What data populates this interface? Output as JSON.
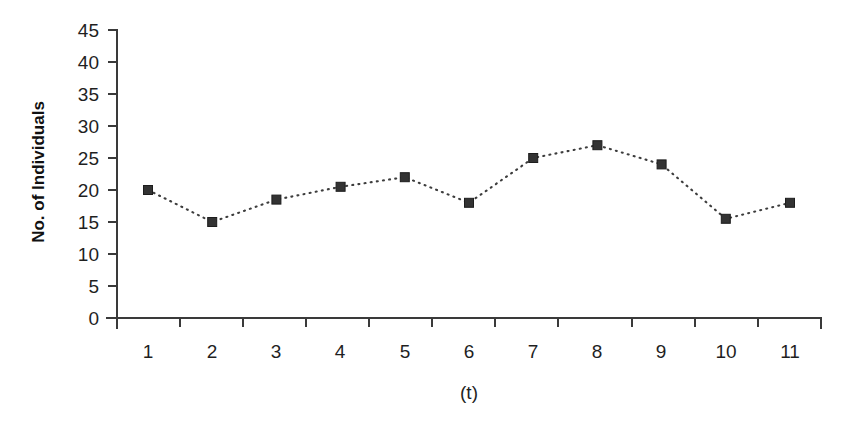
{
  "chart_data": {
    "type": "line",
    "title": "",
    "subtitle": "",
    "xlabel": "(t)",
    "ylabel": "No. of Individuals",
    "x": [
      1,
      2,
      3,
      4,
      5,
      6,
      7,
      8,
      9,
      10,
      11
    ],
    "categories": [
      "1",
      "2",
      "3",
      "4",
      "5",
      "6",
      "7",
      "8",
      "9",
      "10",
      "11"
    ],
    "values": [
      20,
      15,
      18.5,
      20.5,
      22,
      18,
      25,
      27,
      24,
      15.5,
      18
    ],
    "series": [
      {
        "name": "No. of Individuals",
        "values": [
          20,
          15,
          18.5,
          20.5,
          22,
          18,
          25,
          27,
          24,
          15.5,
          18
        ],
        "marker": "square",
        "marker_color": "#333333",
        "line_style": "dotted",
        "line_color": "#3d3d3d"
      }
    ],
    "xlim": [
      0.5,
      11.5
    ],
    "ylim": [
      0,
      45
    ],
    "yticks": [
      0,
      5,
      10,
      15,
      20,
      25,
      30,
      35,
      40,
      45
    ],
    "ytick_labels": [
      "0",
      "5",
      "10",
      "15",
      "20",
      "25",
      "30",
      "35",
      "40",
      "45"
    ],
    "xticks": [
      1,
      2,
      3,
      4,
      5,
      6,
      7,
      8,
      9,
      10,
      11
    ],
    "xtick_labels": [
      "1",
      "2",
      "3",
      "4",
      "5",
      "6",
      "7",
      "8",
      "9",
      "10",
      "11"
    ],
    "grid": false,
    "legend": false,
    "legend_position": "none",
    "background_color": "#ffffff",
    "axis_color": "#3a3a3a",
    "annotations": []
  }
}
